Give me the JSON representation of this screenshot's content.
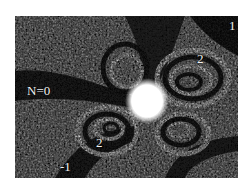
{
  "figure": {
    "background_color": "#ffffff",
    "image_dark": "#111111",
    "image_light": "#e8e8e8",
    "labels": [
      {
        "text": "N=0",
        "x": 27,
        "y": 84
      },
      {
        "text": "1",
        "x": 229,
        "y": 18
      },
      {
        "text": "2",
        "x": 197,
        "y": 52
      },
      {
        "text": "2",
        "x": 96,
        "y": 136
      },
      {
        "text": "-1",
        "x": 58,
        "y": 160
      }
    ]
  }
}
